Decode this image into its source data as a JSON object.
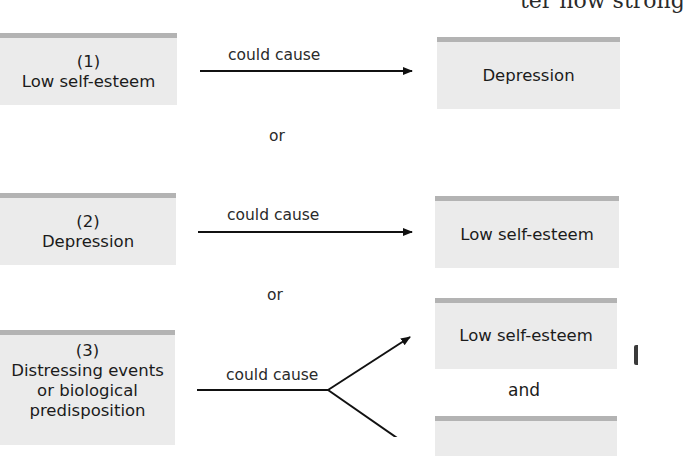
{
  "header": {
    "cutoff_text": "ter how strong"
  },
  "scenarios": [
    {
      "number": "(1)",
      "cause": "Low self-esteem",
      "relation": "could cause",
      "effects": [
        "Depression"
      ]
    },
    {
      "number": "(2)",
      "cause": "Depression",
      "relation": "could cause",
      "effects": [
        "Low self-esteem"
      ]
    },
    {
      "number": "(3)",
      "cause_lines": [
        "Distressing events",
        "or biological",
        "predisposition"
      ],
      "relation": "could cause",
      "effects": [
        "Low self-esteem",
        ""
      ],
      "joiner": "and"
    }
  ],
  "separators": [
    "or",
    "or"
  ],
  "colors": {
    "box_fill": "#ebebeb",
    "box_top_border": "#b3b3b3",
    "arrow": "#111111",
    "text": "#1b1b1b"
  }
}
